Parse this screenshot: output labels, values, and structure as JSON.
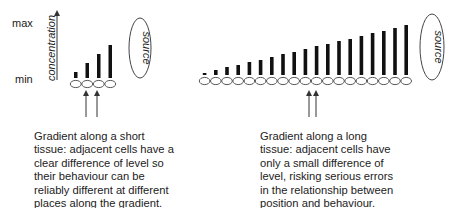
{
  "axis": {
    "max_label": "max",
    "min_label": "min",
    "title": "concentration"
  },
  "short_gradient": {
    "source_label": "source",
    "cells": 4,
    "bar_heights": [
      6,
      15,
      24,
      33
    ],
    "caption": "Gradient along a short\ntissue: adjacent cells have a\nclear difference of level so\ntheir behaviour can be\nreliably different at different\nplaces along the gradient."
  },
  "long_gradient": {
    "source_label": "source",
    "cells": 19,
    "bar_heights": [
      2,
      5,
      8,
      10,
      13,
      15,
      18,
      21,
      23,
      26,
      29,
      31,
      34,
      36,
      39,
      42,
      44,
      47,
      50
    ],
    "caption": "Gradient along a long\ntissue: adjacent cells have\nonly a small difference of\nlevel, risking serious errors\nin the relationship between\nposition and behaviour."
  },
  "colors": {
    "ink": "#1a1a1a",
    "outline": "#555555"
  }
}
